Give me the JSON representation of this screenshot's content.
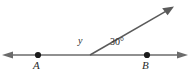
{
  "figure": {
    "background_color": "#ffffff",
    "line_color": "#6b6b6b",
    "ray_color": "#5a5a5a",
    "point_color": "#1a1a1a",
    "text_color": "#2b2b2b"
  },
  "labels": {
    "point_a": "A",
    "point_b": "B",
    "unknown_angle": "y",
    "known_angle": "30°"
  },
  "points": {
    "a": {
      "name": "A",
      "x": 38,
      "y": 55
    },
    "b": {
      "name": "B",
      "x": 147,
      "y": 55
    },
    "vertex": {
      "name": "vertex",
      "x": 90,
      "y": 55
    }
  },
  "lines": {
    "horizontal": {
      "name": "line-AB",
      "x1": 6,
      "y1": 55,
      "x2": 184,
      "y2": 55,
      "arrow_start": true,
      "arrow_end": true
    },
    "ray": {
      "name": "ray-from-vertex",
      "x1": 90,
      "y1": 55,
      "x2": 170,
      "y2": 9,
      "arrow_start": false,
      "arrow_end": true
    }
  },
  "angles": {
    "left_of_ray": {
      "label": "y",
      "value": null
    },
    "right_of_ray": {
      "label": "30°",
      "value": 30
    }
  }
}
